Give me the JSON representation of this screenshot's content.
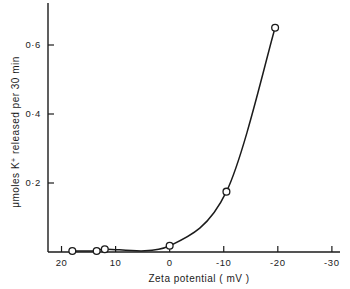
{
  "chart_data": {
    "type": "line",
    "title": "",
    "subtitle": "",
    "xlabel": "Zeta potential  ( mV )",
    "ylabel_parts": {
      "prefix": "μmoles K",
      "superscript": "+",
      "suffix": " released  per  30 min"
    },
    "ylabel": "μmoles K+ released per 30 min",
    "x": [
      18,
      13.5,
      12,
      0,
      -10.5,
      -19.5
    ],
    "y": [
      0.003,
      0.003,
      0.008,
      0.018,
      0.175,
      0.65
    ],
    "series": [
      {
        "name": "K+ released",
        "marker": "open-circle",
        "points": [
          {
            "x": 18,
            "y": 0.003
          },
          {
            "x": 13.5,
            "y": 0.003
          },
          {
            "x": 12,
            "y": 0.008
          },
          {
            "x": 0,
            "y": 0.018
          },
          {
            "x": -10.5,
            "y": 0.175
          },
          {
            "x": -19.5,
            "y": 0.65
          }
        ]
      }
    ],
    "xlim": [
      22.5,
      -31.5
    ],
    "ylim": [
      0,
      0.68
    ],
    "x_reversed": true,
    "xticks": [
      20,
      10,
      0,
      -10,
      -20,
      -30
    ],
    "xticklabels": [
      "20",
      "10",
      "0",
      "-10",
      "-20",
      "-30"
    ],
    "yticks": [
      0.2,
      0.4,
      0.6
    ],
    "yticklabels": [
      "0·2",
      "0·4",
      "0·6"
    ],
    "grid": false,
    "legend": null,
    "legend_position": "none",
    "line_color": "#1b1b1b",
    "marker_face_color": "#ffffff",
    "background_color": "#ffffff",
    "spines": [
      "left",
      "bottom"
    ],
    "annotations": []
  }
}
